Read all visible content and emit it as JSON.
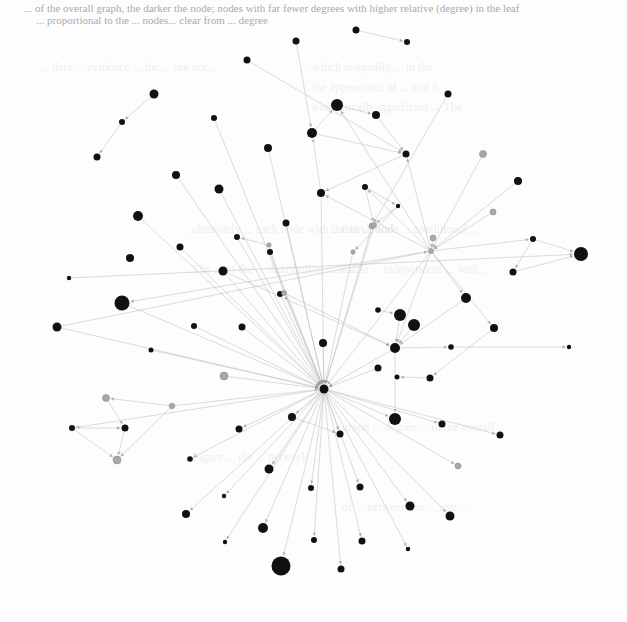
{
  "page": {
    "caption_line1": "... of the overall graph, the darker the node; nodes with far fewer degrees with higher relative (degree) in the leaf",
    "caption_line2": "... proportional to the ... nodes... clear from ... degree",
    "bleed_through_fragments": [
      "... which is equally ... in the",
      "... the appearance of ... and it",
      "... a statistically significant ... The",
      "... data ... evidence ... the ... are not ...",
      "... ultimately ... each node with the DAL and",
      "... The ... of the ... distribution ... a ... ",
      "... that ... node ... conditional ... ",
      "... Table ... independent ... with ... ",
      "... graph ... degree ... in the overall ...",
      "... of ... between the ... and ...",
      "... Figure ... the ... network ..."
    ]
  },
  "chart_data": {
    "type": "network",
    "title": "",
    "directed": true,
    "nodes": [
      {
        "id": "n1",
        "x": 296,
        "y": 41,
        "r": 3.5,
        "color": "dark"
      },
      {
        "id": "n2",
        "x": 356,
        "y": 30,
        "r": 3.5,
        "color": "dark"
      },
      {
        "id": "n3",
        "x": 407,
        "y": 42,
        "r": 3,
        "color": "dark"
      },
      {
        "id": "n4",
        "x": 247,
        "y": 60,
        "r": 3.5,
        "color": "dark"
      },
      {
        "id": "n5",
        "x": 154,
        "y": 94,
        "r": 4.5,
        "color": "dark"
      },
      {
        "id": "n6",
        "x": 122,
        "y": 122,
        "r": 3,
        "color": "dark"
      },
      {
        "id": "n7",
        "x": 214,
        "y": 118,
        "r": 3,
        "color": "dark"
      },
      {
        "id": "n8",
        "x": 97,
        "y": 157,
        "r": 3.5,
        "color": "dark"
      },
      {
        "id": "n9",
        "x": 337,
        "y": 105,
        "r": 6,
        "color": "dark"
      },
      {
        "id": "n10",
        "x": 376,
        "y": 115,
        "r": 4,
        "color": "dark"
      },
      {
        "id": "n11",
        "x": 312,
        "y": 133,
        "r": 5,
        "color": "dark"
      },
      {
        "id": "n12",
        "x": 448,
        "y": 94,
        "r": 3.5,
        "color": "dark"
      },
      {
        "id": "n13",
        "x": 268,
        "y": 148,
        "r": 4,
        "color": "dark"
      },
      {
        "id": "n14",
        "x": 406,
        "y": 154,
        "r": 3.5,
        "color": "dark"
      },
      {
        "id": "n15",
        "x": 483,
        "y": 154,
        "r": 3.5,
        "color": "gray"
      },
      {
        "id": "n16",
        "x": 176,
        "y": 175,
        "r": 4,
        "color": "dark"
      },
      {
        "id": "n17",
        "x": 219,
        "y": 189,
        "r": 4.5,
        "color": "dark"
      },
      {
        "id": "n18",
        "x": 321,
        "y": 193,
        "r": 4,
        "color": "dark"
      },
      {
        "id": "n19",
        "x": 365,
        "y": 187,
        "r": 3,
        "color": "dark"
      },
      {
        "id": "n20",
        "x": 398,
        "y": 206,
        "r": 2.2,
        "color": "dark"
      },
      {
        "id": "n21",
        "x": 518,
        "y": 181,
        "r": 4,
        "color": "dark"
      },
      {
        "id": "n22",
        "x": 138,
        "y": 216,
        "r": 5,
        "color": "dark"
      },
      {
        "id": "n23",
        "x": 286,
        "y": 223,
        "r": 3.5,
        "color": "dark"
      },
      {
        "id": "n24",
        "x": 237,
        "y": 237,
        "r": 3,
        "color": "dark"
      },
      {
        "id": "n25",
        "x": 372,
        "y": 226,
        "r": 3,
        "color": "gray"
      },
      {
        "id": "n26",
        "x": 493,
        "y": 212,
        "r": 3,
        "color": "gray"
      },
      {
        "id": "n27",
        "x": 270,
        "y": 252,
        "r": 3,
        "color": "dark"
      },
      {
        "id": "n28",
        "x": 130,
        "y": 258,
        "r": 4,
        "color": "dark"
      },
      {
        "id": "n29",
        "x": 180,
        "y": 247,
        "r": 3.5,
        "color": "dark"
      },
      {
        "id": "n30",
        "x": 223,
        "y": 271,
        "r": 4.5,
        "color": "dark"
      },
      {
        "id": "n31",
        "x": 433,
        "y": 238,
        "r": 3,
        "color": "gray"
      },
      {
        "id": "n32",
        "x": 533,
        "y": 239,
        "r": 3,
        "color": "dark"
      },
      {
        "id": "n33",
        "x": 581,
        "y": 254,
        "r": 7,
        "color": "dark"
      },
      {
        "id": "n34",
        "x": 513,
        "y": 272,
        "r": 3.5,
        "color": "dark"
      },
      {
        "id": "n35",
        "x": 69,
        "y": 278,
        "r": 2.2,
        "color": "dark"
      },
      {
        "id": "n36",
        "x": 122,
        "y": 303,
        "r": 7.5,
        "color": "dark"
      },
      {
        "id": "n37",
        "x": 57,
        "y": 327,
        "r": 4.5,
        "color": "dark"
      },
      {
        "id": "n38",
        "x": 280,
        "y": 294,
        "r": 3,
        "color": "dark"
      },
      {
        "id": "n39",
        "x": 466,
        "y": 298,
        "r": 5,
        "color": "dark"
      },
      {
        "id": "n40",
        "x": 194,
        "y": 326,
        "r": 3,
        "color": "dark"
      },
      {
        "id": "n41",
        "x": 242,
        "y": 327,
        "r": 3.5,
        "color": "dark"
      },
      {
        "id": "n42",
        "x": 378,
        "y": 310,
        "r": 2.8,
        "color": "dark"
      },
      {
        "id": "n43",
        "x": 400,
        "y": 315,
        "r": 6,
        "color": "dark"
      },
      {
        "id": "n44",
        "x": 414,
        "y": 325,
        "r": 6,
        "color": "dark"
      },
      {
        "id": "n45",
        "x": 494,
        "y": 328,
        "r": 4,
        "color": "dark"
      },
      {
        "id": "n46",
        "x": 323,
        "y": 343,
        "r": 4,
        "color": "dark"
      },
      {
        "id": "n47",
        "x": 395,
        "y": 348,
        "r": 5,
        "color": "dark"
      },
      {
        "id": "n48",
        "x": 151,
        "y": 350,
        "r": 2.5,
        "color": "dark"
      },
      {
        "id": "n49",
        "x": 451,
        "y": 347,
        "r": 2.8,
        "color": "dark"
      },
      {
        "id": "n50",
        "x": 569,
        "y": 347,
        "r": 2.2,
        "color": "dark"
      },
      {
        "id": "n51",
        "x": 224,
        "y": 376,
        "r": 4,
        "color": "gray"
      },
      {
        "id": "n52",
        "x": 378,
        "y": 368,
        "r": 3.5,
        "color": "dark"
      },
      {
        "id": "n53",
        "x": 430,
        "y": 378,
        "r": 3.5,
        "color": "dark"
      },
      {
        "id": "n54",
        "x": 324,
        "y": 389,
        "r": 4.5,
        "color": "dark",
        "role": "hub"
      },
      {
        "id": "n55",
        "x": 106,
        "y": 398,
        "r": 3.5,
        "color": "gray"
      },
      {
        "id": "n56",
        "x": 172,
        "y": 406,
        "r": 2.8,
        "color": "gray"
      },
      {
        "id": "n57",
        "x": 397,
        "y": 377,
        "r": 2.5,
        "color": "dark"
      },
      {
        "id": "n58",
        "x": 292,
        "y": 417,
        "r": 4,
        "color": "dark"
      },
      {
        "id": "n59",
        "x": 72,
        "y": 428,
        "r": 3,
        "color": "dark"
      },
      {
        "id": "n60",
        "x": 125,
        "y": 428,
        "r": 3.5,
        "color": "dark"
      },
      {
        "id": "n61",
        "x": 340,
        "y": 434,
        "r": 3.5,
        "color": "dark"
      },
      {
        "id": "n62",
        "x": 395,
        "y": 419,
        "r": 6,
        "color": "dark"
      },
      {
        "id": "n63",
        "x": 442,
        "y": 424,
        "r": 3.5,
        "color": "dark"
      },
      {
        "id": "n64",
        "x": 500,
        "y": 435,
        "r": 3.5,
        "color": "dark"
      },
      {
        "id": "n65",
        "x": 239,
        "y": 429,
        "r": 3.5,
        "color": "dark"
      },
      {
        "id": "n66",
        "x": 117,
        "y": 460,
        "r": 4,
        "color": "gray"
      },
      {
        "id": "n67",
        "x": 190,
        "y": 459,
        "r": 2.8,
        "color": "dark"
      },
      {
        "id": "n68",
        "x": 269,
        "y": 469,
        "r": 4.5,
        "color": "dark"
      },
      {
        "id": "n69",
        "x": 458,
        "y": 466,
        "r": 3,
        "color": "gray"
      },
      {
        "id": "n70",
        "x": 224,
        "y": 496,
        "r": 2.2,
        "color": "dark"
      },
      {
        "id": "n71",
        "x": 311,
        "y": 488,
        "r": 3,
        "color": "dark"
      },
      {
        "id": "n72",
        "x": 360,
        "y": 487,
        "r": 3.5,
        "color": "dark"
      },
      {
        "id": "n73",
        "x": 410,
        "y": 506,
        "r": 4.5,
        "color": "dark"
      },
      {
        "id": "n74",
        "x": 450,
        "y": 516,
        "r": 4.5,
        "color": "dark"
      },
      {
        "id": "n75",
        "x": 186,
        "y": 514,
        "r": 4,
        "color": "dark"
      },
      {
        "id": "n76",
        "x": 263,
        "y": 528,
        "r": 5,
        "color": "dark"
      },
      {
        "id": "n77",
        "x": 225,
        "y": 542,
        "r": 2.2,
        "color": "dark"
      },
      {
        "id": "n78",
        "x": 314,
        "y": 540,
        "r": 3,
        "color": "dark"
      },
      {
        "id": "n79",
        "x": 362,
        "y": 541,
        "r": 3.5,
        "color": "dark"
      },
      {
        "id": "n80",
        "x": 408,
        "y": 549,
        "r": 2.2,
        "color": "dark"
      },
      {
        "id": "n81",
        "x": 281,
        "y": 566,
        "r": 9.5,
        "color": "dark"
      },
      {
        "id": "n82",
        "x": 341,
        "y": 569,
        "r": 3.5,
        "color": "dark"
      },
      {
        "id": "n83",
        "x": 431,
        "y": 251,
        "r": 2.5,
        "color": "gray",
        "role": "hub2"
      },
      {
        "id": "n84",
        "x": 374,
        "y": 225,
        "r": 2.5,
        "color": "gray"
      },
      {
        "id": "n85",
        "x": 353,
        "y": 252,
        "r": 2.2,
        "color": "gray"
      },
      {
        "id": "n86",
        "x": 284,
        "y": 293,
        "r": 2.5,
        "color": "gray"
      },
      {
        "id": "n87",
        "x": 269,
        "y": 245,
        "r": 2.2,
        "color": "gray"
      }
    ],
    "edges": [
      [
        "n2",
        "n3"
      ],
      [
        "n1",
        "n11"
      ],
      [
        "n4",
        "n14"
      ],
      [
        "n5",
        "n6"
      ],
      [
        "n6",
        "n8"
      ],
      [
        "n11",
        "n9"
      ],
      [
        "n9",
        "n10"
      ],
      [
        "n10",
        "n14"
      ],
      [
        "n11",
        "n14"
      ],
      [
        "n12",
        "n25"
      ],
      [
        "n14",
        "n18"
      ],
      [
        "n15",
        "n83"
      ],
      [
        "n18",
        "n11"
      ],
      [
        "n19",
        "n20"
      ],
      [
        "n19",
        "n84"
      ],
      [
        "n20",
        "n84"
      ],
      [
        "n20",
        "n85"
      ],
      [
        "n21",
        "n83"
      ],
      [
        "n26",
        "n83"
      ],
      [
        "n31",
        "n83"
      ],
      [
        "n32",
        "n33"
      ],
      [
        "n32",
        "n34"
      ],
      [
        "n34",
        "n33"
      ],
      [
        "n83",
        "n32"
      ],
      [
        "n83",
        "n39"
      ],
      [
        "n83",
        "n45"
      ],
      [
        "n83",
        "n47"
      ],
      [
        "n83",
        "n36"
      ],
      [
        "n83",
        "n54"
      ],
      [
        "n83",
        "n14"
      ],
      [
        "n83",
        "n9"
      ],
      [
        "n83",
        "n18"
      ],
      [
        "n83",
        "n19"
      ],
      [
        "n39",
        "n47"
      ],
      [
        "n42",
        "n43"
      ],
      [
        "n43",
        "n47"
      ],
      [
        "n44",
        "n47"
      ],
      [
        "n47",
        "n49"
      ],
      [
        "n49",
        "n50"
      ],
      [
        "n47",
        "n54"
      ],
      [
        "n47",
        "n62"
      ],
      [
        "n45",
        "n53"
      ],
      [
        "n53",
        "n57"
      ],
      [
        "n52",
        "n54"
      ],
      [
        "n46",
        "n54"
      ],
      [
        "n38",
        "n54"
      ],
      [
        "n16",
        "n54"
      ],
      [
        "n17",
        "n54"
      ],
      [
        "n22",
        "n54"
      ],
      [
        "n24",
        "n54"
      ],
      [
        "n27",
        "n54"
      ],
      [
        "n29",
        "n54"
      ],
      [
        "n30",
        "n54"
      ],
      [
        "n13",
        "n54"
      ],
      [
        "n7",
        "n54"
      ],
      [
        "n23",
        "n54"
      ],
      [
        "n36",
        "n54"
      ],
      [
        "n37",
        "n54"
      ],
      [
        "n41",
        "n54"
      ],
      [
        "n40",
        "n54"
      ],
      [
        "n48",
        "n54"
      ],
      [
        "n51",
        "n54"
      ],
      [
        "n56",
        "n54"
      ],
      [
        "n56",
        "n55"
      ],
      [
        "n55",
        "n60"
      ],
      [
        "n59",
        "n60"
      ],
      [
        "n60",
        "n66"
      ],
      [
        "n59",
        "n66"
      ],
      [
        "n56",
        "n66"
      ],
      [
        "n54",
        "n58"
      ],
      [
        "n58",
        "n61"
      ],
      [
        "n54",
        "n61"
      ],
      [
        "n54",
        "n62"
      ],
      [
        "n54",
        "n63"
      ],
      [
        "n54",
        "n64"
      ],
      [
        "n54",
        "n65"
      ],
      [
        "n54",
        "n67"
      ],
      [
        "n54",
        "n68"
      ],
      [
        "n54",
        "n69"
      ],
      [
        "n54",
        "n70"
      ],
      [
        "n54",
        "n71"
      ],
      [
        "n54",
        "n72"
      ],
      [
        "n54",
        "n73"
      ],
      [
        "n54",
        "n74"
      ],
      [
        "n54",
        "n75"
      ],
      [
        "n54",
        "n76"
      ],
      [
        "n54",
        "n77"
      ],
      [
        "n54",
        "n78"
      ],
      [
        "n54",
        "n79"
      ],
      [
        "n54",
        "n80"
      ],
      [
        "n54",
        "n81"
      ],
      [
        "n54",
        "n82"
      ],
      [
        "n54",
        "n59"
      ],
      [
        "n54",
        "n86"
      ],
      [
        "n86",
        "n87"
      ],
      [
        "n87",
        "n24"
      ],
      [
        "n85",
        "n54"
      ],
      [
        "n84",
        "n54"
      ],
      [
        "n25",
        "n54"
      ],
      [
        "n18",
        "n54"
      ],
      [
        "n35",
        "n33"
      ],
      [
        "n37",
        "n83"
      ],
      [
        "n30",
        "n47"
      ],
      [
        "n86",
        "n47"
      ]
    ]
  }
}
